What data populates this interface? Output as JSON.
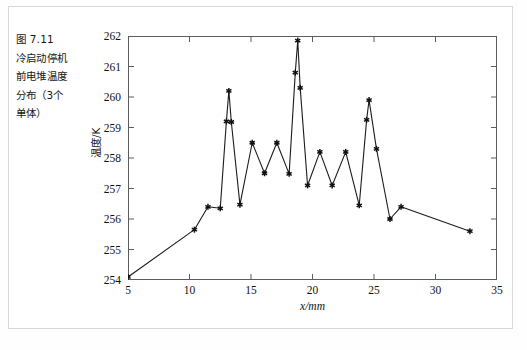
{
  "caption": {
    "text": "图 7.11\n冷启动停机\n前电堆温度\n分布（3个\n单体）"
  },
  "axis": {
    "xlabel": "x/mm",
    "ylabel": "温度/K",
    "xticks": [
      "5",
      "10",
      "15",
      "20",
      "25",
      "30",
      "35"
    ],
    "yticks": [
      "254",
      "255",
      "256",
      "257",
      "258",
      "259",
      "260",
      "261",
      "262"
    ]
  },
  "style": {
    "line_color": "#1c1c1c",
    "marker_color": "#111111",
    "frame_color": "#5d5d5d",
    "outer_border_color": "#d8d8d8",
    "background": "#ffffff"
  },
  "chart_data": {
    "type": "line",
    "title": "",
    "subtitle": "",
    "xlabel": "x/mm",
    "ylabel": "温度/K",
    "xlim": [
      5,
      35
    ],
    "ylim": [
      254,
      262
    ],
    "xticks": [
      5,
      10,
      15,
      20,
      25,
      30,
      35
    ],
    "yticks": [
      254,
      255,
      256,
      257,
      258,
      259,
      260,
      261,
      262
    ],
    "grid": false,
    "legend": null,
    "legend_position": "none",
    "markers": "star",
    "annotations": [],
    "series": [
      {
        "name": "电堆温度分布",
        "x": [
          5.0,
          10.4,
          11.5,
          12.5,
          13.0,
          13.2,
          13.4,
          14.1,
          15.1,
          16.1,
          17.1,
          18.1,
          18.6,
          18.8,
          19.0,
          19.6,
          20.6,
          21.6,
          22.7,
          23.8,
          24.4,
          24.6,
          25.2,
          26.3,
          27.2,
          32.8
        ],
        "y": [
          254.1,
          255.65,
          256.4,
          256.35,
          259.2,
          260.2,
          259.18,
          256.47,
          258.5,
          257.5,
          258.5,
          257.48,
          260.8,
          261.85,
          260.3,
          257.1,
          258.2,
          257.1,
          258.2,
          256.45,
          259.25,
          259.9,
          258.3,
          256.0,
          256.4,
          255.6
        ]
      }
    ]
  }
}
